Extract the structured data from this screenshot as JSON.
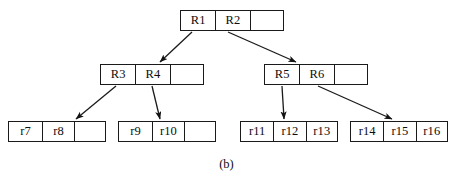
{
  "figure": {
    "caption": "(b)",
    "stroke_color": "#1a1a1a",
    "background_color": "#ffffff"
  },
  "tree": {
    "root": {
      "name": "root-node",
      "x": 180,
      "y": 10,
      "width": 104,
      "height": 21,
      "cells": [
        {
          "label": "R1",
          "width": 35
        },
        {
          "label": "R2",
          "width": 35
        },
        {
          "label": "",
          "width": 34
        }
      ]
    },
    "internal": [
      {
        "name": "internal-node-left",
        "x": 100,
        "y": 64,
        "width": 104,
        "height": 21,
        "cells": [
          {
            "label": "R3",
            "width": 35
          },
          {
            "label": "R4",
            "width": 35
          },
          {
            "label": "",
            "width": 34
          }
        ]
      },
      {
        "name": "internal-node-right",
        "x": 264,
        "y": 64,
        "width": 104,
        "height": 21,
        "cells": [
          {
            "label": "R5",
            "width": 35
          },
          {
            "label": "R6",
            "width": 35
          },
          {
            "label": "",
            "width": 34
          }
        ]
      }
    ],
    "leaves": [
      {
        "name": "leaf-node-1",
        "x": 8,
        "y": 121,
        "width": 98,
        "height": 21,
        "cells": [
          {
            "label": "r7",
            "width": 34
          },
          {
            "label": "r8",
            "width": 32
          },
          {
            "label": "",
            "width": 32
          }
        ]
      },
      {
        "name": "leaf-node-2",
        "x": 118,
        "y": 121,
        "width": 98,
        "height": 21,
        "cells": [
          {
            "label": "r9",
            "width": 34
          },
          {
            "label": "r10",
            "width": 32
          },
          {
            "label": "",
            "width": 32
          }
        ]
      },
      {
        "name": "leaf-node-3",
        "x": 240,
        "y": 121,
        "width": 98,
        "height": 21,
        "cells": [
          {
            "label": "r11",
            "width": 33
          },
          {
            "label": "r12",
            "width": 33
          },
          {
            "label": "r13",
            "width": 32
          }
        ]
      },
      {
        "name": "leaf-node-4",
        "x": 350,
        "y": 121,
        "width": 98,
        "height": 21,
        "cells": [
          {
            "label": "r14",
            "width": 33
          },
          {
            "label": "r15",
            "width": 33
          },
          {
            "label": "r16",
            "width": 32
          }
        ]
      }
    ],
    "edges": [
      {
        "name": "edge-r1-to-internal-left",
        "from": "R1",
        "to": "internal-node-left",
        "x1": 192,
        "y1": 32,
        "x2": 160,
        "y2": 62
      },
      {
        "name": "edge-r2-to-internal-right",
        "from": "R2",
        "to": "internal-node-right",
        "x1": 228,
        "y1": 32,
        "x2": 296,
        "y2": 62
      },
      {
        "name": "edge-r3-to-leaf-1",
        "from": "R3",
        "to": "leaf-node-1",
        "x1": 116,
        "y1": 86,
        "x2": 76,
        "y2": 119
      },
      {
        "name": "edge-r4-to-leaf-2",
        "from": "R4",
        "to": "leaf-node-2",
        "x1": 152,
        "y1": 86,
        "x2": 160,
        "y2": 119
      },
      {
        "name": "edge-r5-to-leaf-3",
        "from": "R5",
        "to": "leaf-node-3",
        "x1": 282,
        "y1": 86,
        "x2": 284,
        "y2": 119
      },
      {
        "name": "edge-r6-to-leaf-4",
        "from": "R6",
        "to": "leaf-node-4",
        "x1": 318,
        "y1": 86,
        "x2": 392,
        "y2": 119
      }
    ]
  }
}
